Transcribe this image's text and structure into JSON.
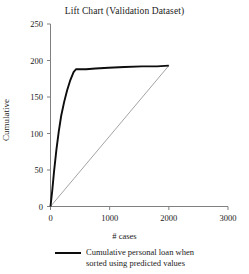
{
  "chart_data": {
    "type": "line",
    "title": "Lift Chart (Validation Dataset)",
    "xlabel": "# cases",
    "ylabel": "Cumulative",
    "xlim": [
      0,
      3000
    ],
    "ylim": [
      0,
      250
    ],
    "xticks": [
      0,
      1000,
      2000,
      3000
    ],
    "yticks": [
      0,
      50,
      100,
      150,
      200,
      250
    ],
    "grid": false,
    "legend_position": "bottom",
    "series": [
      {
        "name": "Cumulative personal loan when sorted using predicted values",
        "color": "#0d0d0d",
        "width": 1.9,
        "points": [
          [
            0,
            0
          ],
          [
            30,
            22
          ],
          [
            60,
            48
          ],
          [
            100,
            78
          ],
          [
            140,
            103
          ],
          [
            180,
            124
          ],
          [
            230,
            143
          ],
          [
            280,
            159
          ],
          [
            330,
            172
          ],
          [
            390,
            184
          ],
          [
            430,
            188
          ],
          [
            600,
            188
          ],
          [
            760,
            189
          ],
          [
            980,
            190
          ],
          [
            1250,
            191
          ],
          [
            1550,
            192
          ],
          [
            1800,
            192
          ],
          [
            2000,
            193
          ]
        ]
      },
      {
        "name": "baseline",
        "color": "#8c8c8c",
        "width": 0.8,
        "points": [
          [
            0,
            0
          ],
          [
            2000,
            193
          ]
        ]
      }
    ],
    "legend_entries": [
      {
        "swatch_color": "#0d0d0d",
        "line1": "Cumulative personal loan when",
        "line2": "sorted using predicted values"
      }
    ]
  },
  "axis": {
    "ytick_labels": [
      "0",
      "50",
      "100",
      "150",
      "200",
      "250"
    ],
    "xtick_labels": [
      "0",
      "1000",
      "2000",
      "3000"
    ],
    "spine_color": "#808080"
  }
}
